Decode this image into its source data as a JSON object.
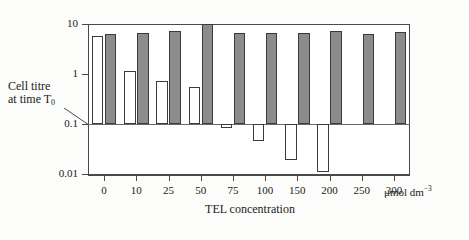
{
  "figure": {
    "background": "#fcfcfa",
    "frame_color": "#4a4a4a"
  },
  "axes": {
    "y_label_line1": "Cell titre",
    "y_label_line2_pre": "at time T",
    "y_label_line2_sub": "0",
    "y_ticks": [
      "10",
      "1",
      "0.1",
      "0.01"
    ],
    "x_label": "TEL concentration",
    "x_tick_labels": [
      "0",
      "10",
      "25",
      "50",
      "75",
      "100",
      "150",
      "200",
      "250",
      "300"
    ],
    "x_units_text": "μmol dm",
    "x_units_sup": "−3",
    "reference_value": "0.1"
  },
  "chart_data": {
    "type": "bar",
    "title": "",
    "xlabel": "TEL concentration",
    "ylabel": "Cell titre at time T0",
    "x_units": "μmol dm−3",
    "yscale": "log",
    "ylim": [
      0.004,
      10
    ],
    "ytick_values": [
      10,
      1,
      0.1,
      0.01
    ],
    "baseline": 0.1,
    "grid": false,
    "legend_position": "none",
    "note": "Paired bars per concentration: open (white) bar and filled (grey) bar. Bars extending below the 0.1 baseline indicate titre fall below the time-T0 reference.",
    "categories": [
      "0",
      "10",
      "25",
      "50",
      "75",
      "100",
      "150",
      "200",
      "250",
      "300"
    ],
    "series": [
      {
        "name": "open bars",
        "fill": "#ffffff",
        "values": [
          5.8,
          1.15,
          0.72,
          0.55,
          0.085,
          0.046,
          0.019,
          0.011,
          null,
          null
        ]
      },
      {
        "name": "filled bars",
        "fill": "#8c8c8c",
        "values": [
          6.4,
          6.6,
          7.4,
          10.0,
          6.6,
          6.6,
          6.6,
          7.2,
          6.2,
          6.8
        ]
      }
    ]
  },
  "colors": {
    "filled_bar": "#8c8c8c",
    "open_bar": "#ffffff",
    "bar_outline": "#3b3b3b",
    "axis": "#4a4a4a"
  }
}
